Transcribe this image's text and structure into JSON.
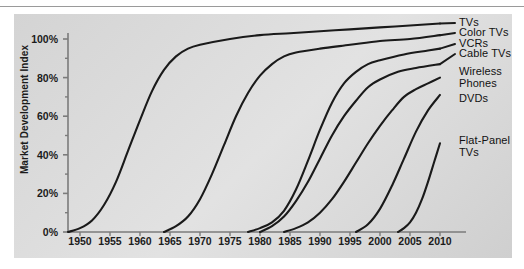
{
  "chart_data": {
    "type": "line",
    "title": "",
    "subtitle": "",
    "xlabel": "",
    "ylabel": "Market Development Index",
    "xlim": [
      1948,
      2012
    ],
    "ylim": [
      0,
      110
    ],
    "grid": false,
    "legend_position": "right-inline-labels",
    "y_tick_labels": [
      "0%",
      "20%",
      "40%",
      "60%",
      "80%",
      "100%"
    ],
    "y_ticks": [
      0,
      20,
      40,
      60,
      80,
      100
    ],
    "y_minor_ticks": [
      10,
      30,
      50,
      70,
      90
    ],
    "x_tick_labels": [
      "1950",
      "1955",
      "1960",
      "1965",
      "1970",
      "1975",
      "1980",
      "1985",
      "1990",
      "1995",
      "2000",
      "2005",
      "2010"
    ],
    "x_ticks": [
      1950,
      1955,
      1960,
      1965,
      1970,
      1975,
      1980,
      1985,
      1990,
      1995,
      2000,
      2005,
      2010
    ],
    "line_color": "#1a1a1a",
    "panel_color": "#dcdcdc",
    "series": [
      {
        "name": "TVs",
        "label": "TVs",
        "points": [
          [
            1948,
            0
          ],
          [
            1950,
            2
          ],
          [
            1952,
            6
          ],
          [
            1954,
            14
          ],
          [
            1956,
            26
          ],
          [
            1958,
            42
          ],
          [
            1960,
            58
          ],
          [
            1962,
            73
          ],
          [
            1964,
            84
          ],
          [
            1966,
            91
          ],
          [
            1968,
            95
          ],
          [
            1970,
            97
          ],
          [
            1975,
            100
          ],
          [
            1980,
            102
          ],
          [
            1985,
            103
          ],
          [
            1990,
            104
          ],
          [
            1995,
            105
          ],
          [
            2000,
            106
          ],
          [
            2005,
            107
          ],
          [
            2010,
            108
          ]
        ]
      },
      {
        "name": "Color TVs",
        "label": "Color TVs",
        "points": [
          [
            1964,
            0
          ],
          [
            1966,
            3
          ],
          [
            1968,
            8
          ],
          [
            1970,
            17
          ],
          [
            1972,
            30
          ],
          [
            1974,
            45
          ],
          [
            1976,
            60
          ],
          [
            1978,
            72
          ],
          [
            1980,
            81
          ],
          [
            1982,
            87
          ],
          [
            1984,
            91
          ],
          [
            1986,
            93
          ],
          [
            1990,
            95
          ],
          [
            1995,
            97
          ],
          [
            2000,
            99
          ],
          [
            2005,
            100
          ],
          [
            2010,
            102
          ]
        ]
      },
      {
        "name": "VCRs",
        "label": "VCRs",
        "points": [
          [
            1978,
            0
          ],
          [
            1980,
            2
          ],
          [
            1982,
            5
          ],
          [
            1984,
            11
          ],
          [
            1986,
            22
          ],
          [
            1988,
            37
          ],
          [
            1990,
            53
          ],
          [
            1992,
            67
          ],
          [
            1994,
            77
          ],
          [
            1996,
            83
          ],
          [
            1998,
            87
          ],
          [
            2000,
            89
          ],
          [
            2004,
            92
          ],
          [
            2008,
            94
          ],
          [
            2010,
            95
          ]
        ]
      },
      {
        "name": "Cable TVs",
        "label": "Cable TVs",
        "points": [
          [
            1980,
            0
          ],
          [
            1982,
            3
          ],
          [
            1984,
            8
          ],
          [
            1986,
            16
          ],
          [
            1988,
            26
          ],
          [
            1990,
            38
          ],
          [
            1992,
            50
          ],
          [
            1994,
            60
          ],
          [
            1996,
            68
          ],
          [
            1998,
            75
          ],
          [
            2000,
            79
          ],
          [
            2003,
            83
          ],
          [
            2006,
            85
          ],
          [
            2010,
            87
          ]
        ]
      },
      {
        "name": "Wireless Phones",
        "label": "Wireless\nPhones",
        "points": [
          [
            1984,
            0
          ],
          [
            1986,
            2
          ],
          [
            1988,
            5
          ],
          [
            1990,
            10
          ],
          [
            1992,
            17
          ],
          [
            1994,
            26
          ],
          [
            1996,
            36
          ],
          [
            1998,
            46
          ],
          [
            2000,
            55
          ],
          [
            2002,
            63
          ],
          [
            2004,
            70
          ],
          [
            2006,
            74
          ],
          [
            2008,
            77
          ],
          [
            2010,
            80
          ]
        ]
      },
      {
        "name": "DVDs",
        "label": "DVDs",
        "points": [
          [
            1996,
            0
          ],
          [
            1998,
            4
          ],
          [
            2000,
            12
          ],
          [
            2002,
            24
          ],
          [
            2004,
            38
          ],
          [
            2006,
            52
          ],
          [
            2008,
            63
          ],
          [
            2010,
            71
          ]
        ]
      },
      {
        "name": "Flat-Panel TVs",
        "label": "Flat-Panel\nTVs",
        "points": [
          [
            2003,
            0
          ],
          [
            2004,
            2
          ],
          [
            2005,
            5
          ],
          [
            2006,
            10
          ],
          [
            2007,
            17
          ],
          [
            2008,
            26
          ],
          [
            2009,
            36
          ],
          [
            2010,
            46
          ]
        ]
      }
    ]
  },
  "axis": {
    "y_title": "Market Development Index"
  },
  "labels": {
    "tvs": "TVs",
    "color_tvs": "Color TVs",
    "vcrs": "VCRs",
    "cable_tvs": "Cable TVs",
    "wireless_phones": "Wireless\nPhones",
    "dvds": "DVDs",
    "flat_panel_tvs": "Flat-Panel\nTVs"
  }
}
